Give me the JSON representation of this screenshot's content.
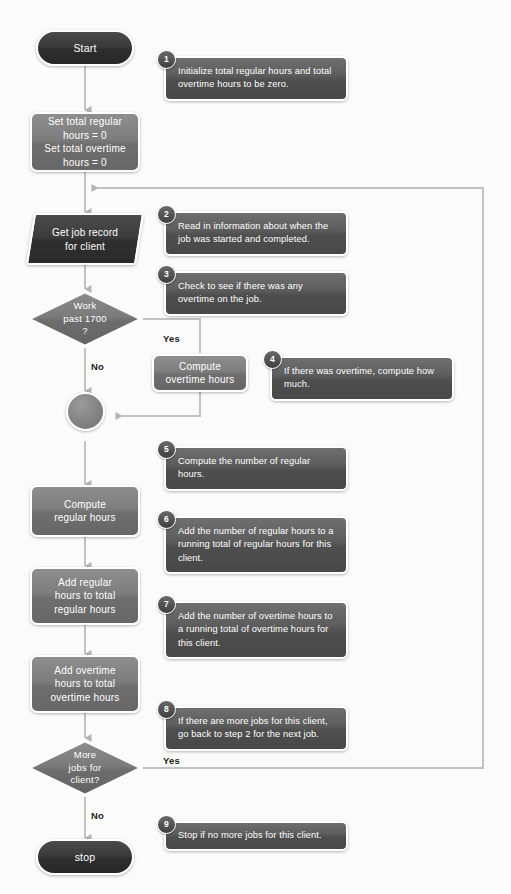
{
  "diagram": {
    "colors": {
      "terminator_fill": "#2e2e2e",
      "process_fill": "#7d7d7d",
      "data_fill": "#3a3a3a",
      "callout_fill": "#565656",
      "connector_line": "#b8b8b8",
      "node_text": "#ffffff",
      "branch_text": "#222222",
      "background": "#fbfbfb"
    },
    "nodes": [
      {
        "id": "start",
        "type": "terminator",
        "label": "Start"
      },
      {
        "id": "init-totals",
        "type": "process",
        "label": "Set total regular\nhours = 0\nSet total overtime\nhours = 0"
      },
      {
        "id": "get-job-record",
        "type": "data",
        "label": "Get job record\nfor client"
      },
      {
        "id": "work-past-1700",
        "type": "decision",
        "label": "Work\npast 1700\n?"
      },
      {
        "id": "compute-overtime",
        "type": "process",
        "label": "Compute\novertime hours"
      },
      {
        "id": "merge-connector",
        "type": "connector",
        "label": ""
      },
      {
        "id": "compute-regular",
        "type": "process",
        "label": "Compute\nregular hours"
      },
      {
        "id": "add-regular",
        "type": "process",
        "label": "Add regular\nhours to total\nregular hours"
      },
      {
        "id": "add-overtime",
        "type": "process",
        "label": "Add overtime\nhours to total\novertime hours"
      },
      {
        "id": "more-jobs",
        "type": "decision",
        "label": "More\njobs for\nclient?"
      },
      {
        "id": "stop",
        "type": "terminator",
        "label": "stop"
      }
    ],
    "branch_labels": {
      "overtime_yes": "Yes",
      "overtime_no": "No",
      "more_jobs_yes": "Yes",
      "more_jobs_no": "No"
    },
    "callouts": [
      {
        "number": "1",
        "text": "Initialize total regular hours and total overtime hours to be zero."
      },
      {
        "number": "2",
        "text": "Read in information about when the job was started and completed."
      },
      {
        "number": "3",
        "text": "Check to see if there was any overtime on the job."
      },
      {
        "number": "4",
        "text": "If there was overtime, compute how much."
      },
      {
        "number": "5",
        "text": "Compute the number of regular hours."
      },
      {
        "number": "6",
        "text": "Add the number of regular hours to a running total of regular hours for this client."
      },
      {
        "number": "7",
        "text": "Add the number of overtime hours to a running total of overtime hours for this client."
      },
      {
        "number": "8",
        "text": "If there are more jobs for this client, go back to step 2 for the next job."
      },
      {
        "number": "9",
        "text": "Stop if no more jobs for this client."
      }
    ]
  }
}
